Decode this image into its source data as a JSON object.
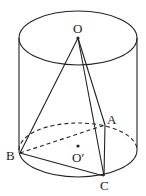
{
  "diagram": {
    "colors": {
      "stroke": "#222222",
      "background": "#ffffff"
    },
    "cylinder": {
      "top_ellipse": {
        "cx": 78,
        "cy": 38,
        "rx": 59,
        "ry": 27
      },
      "bottom_ellipse": {
        "cx": 78,
        "cy": 150,
        "rx": 59,
        "ry": 27
      },
      "left_x": 19,
      "right_x": 137
    },
    "points": {
      "O": {
        "label": "O",
        "x": 78,
        "y": 38
      },
      "O_prime": {
        "label": "O′",
        "x": 79,
        "y": 150
      },
      "A": {
        "label": "A",
        "x": 105,
        "y": 125
      },
      "B": {
        "label": "B",
        "x": 20,
        "y": 153
      },
      "C": {
        "label": "C",
        "x": 104,
        "y": 176
      }
    },
    "labels": {
      "O": "O",
      "O_prime": "O′",
      "A": "A",
      "B": "B",
      "C": "C"
    },
    "segments": [
      {
        "from": "O",
        "to": "A",
        "style": "solid"
      },
      {
        "from": "O",
        "to": "B",
        "style": "solid"
      },
      {
        "from": "O",
        "to": "C",
        "style": "solid"
      },
      {
        "from": "A",
        "to": "C",
        "style": "solid"
      },
      {
        "from": "B",
        "to": "C",
        "style": "solid"
      },
      {
        "from": "B",
        "to": "A",
        "style": "dashed"
      }
    ]
  }
}
